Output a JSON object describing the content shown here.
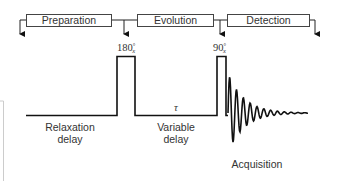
{
  "stages": [
    {
      "label": "Preparation"
    },
    {
      "label": "Evolution"
    },
    {
      "label": "Detection"
    }
  ],
  "pulses": [
    {
      "angle": "180",
      "degree": "°",
      "phase": "x"
    },
    {
      "angle": "90",
      "degree": "°",
      "phase": "x"
    }
  ],
  "delays": {
    "tau_symbol": "τ",
    "relaxation_line1": "Relaxation",
    "relaxation_line2": "delay",
    "variable_line1": "Variable",
    "variable_line2": "delay"
  },
  "acquisition_label": "Acquisition"
}
